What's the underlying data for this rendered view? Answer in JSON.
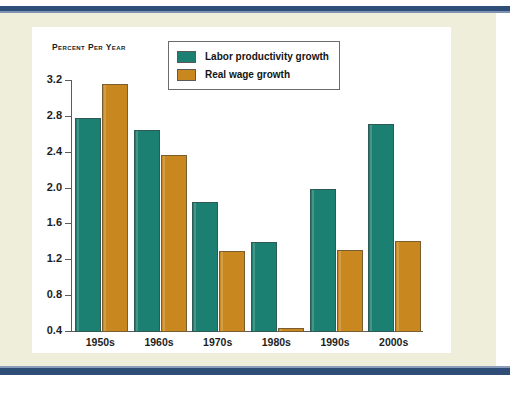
{
  "chart_data": {
    "type": "bar",
    "title": "",
    "subtitle": "",
    "ylabel": "Percent Per Year",
    "xlabel": "",
    "categories": [
      "1950s",
      "1960s",
      "1970s",
      "1980s",
      "1990s",
      "2000s"
    ],
    "series": [
      {
        "name": "Labor productivity growth",
        "color": "#1b7f71",
        "values": [
          2.79,
          2.65,
          1.85,
          1.4,
          1.99,
          2.72
        ]
      },
      {
        "name": "Real wage growth",
        "color": "#c8881f",
        "values": [
          3.17,
          2.38,
          1.3,
          0.45,
          1.32,
          1.42
        ]
      }
    ],
    "yticks": [
      "0.4",
      "0.8",
      "1.2",
      "1.6",
      "2.0",
      "2.4",
      "2.8",
      "3.2"
    ],
    "ytick_values": [
      0.4,
      0.8,
      1.2,
      1.6,
      2.0,
      2.4,
      2.8,
      3.2
    ],
    "ylim": [
      0.4,
      3.2
    ],
    "grid": false,
    "legend_position": "top-center",
    "legend": [
      "Labor productivity growth",
      "Real wage growth"
    ]
  },
  "figure": {
    "axis_title": "Percent Per Year",
    "background_color": "#eeeedb",
    "card_color": "#ffffff",
    "rule_color": "#2e4d77",
    "axis_color": "#5c5c5c"
  },
  "legend": {
    "items": [
      {
        "label": "Labor productivity growth",
        "color": "#1b7f71"
      },
      {
        "label": "Real wage growth",
        "color": "#c8881f"
      }
    ]
  }
}
